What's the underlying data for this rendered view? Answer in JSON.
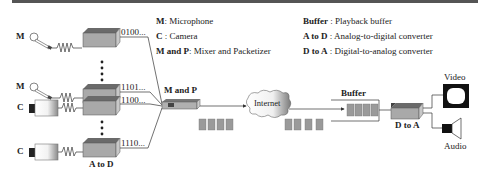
{
  "legend_left": [
    {
      "key": "M",
      "sep": ": ",
      "desc": "Microphone"
    },
    {
      "key": "C",
      "sep": " : ",
      "desc": "Camera"
    },
    {
      "key": "M and P",
      "sep": ": ",
      "desc": "Mixer and Packetizer"
    }
  ],
  "legend_right": [
    {
      "key": "Buffer",
      "sep": " : ",
      "desc": "Playback buffer"
    },
    {
      "key": "A to D",
      "sep": " : ",
      "desc": "Analog-to-digital converter"
    },
    {
      "key": "D to A",
      "sep": " : ",
      "desc": "Digital-to-analog converter"
    }
  ],
  "sources": [
    {
      "type": "M",
      "code": "0100..."
    },
    {
      "type": "M",
      "code": "1101..."
    },
    {
      "type": "C",
      "code": "1100..."
    },
    {
      "type": "C",
      "code": "1110..."
    }
  ],
  "labels": {
    "a_to_d": "A to D",
    "m_and_p": "M and P",
    "internet": "Internet",
    "buffer": "Buffer",
    "d_to_a": "D to A",
    "video": "Video",
    "audio": "Audio"
  },
  "colors": {
    "box_top": "#6a6a6a",
    "box_front": "#a9a9a9",
    "packet": "#9a9a9a",
    "line": "#333333"
  }
}
